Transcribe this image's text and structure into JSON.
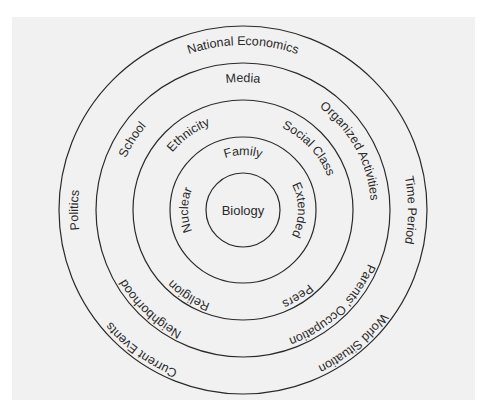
{
  "diagram": {
    "type": "concentric-circles",
    "center": {
      "label": "Biology"
    },
    "rings": [
      {
        "level": 1,
        "labels": {
          "top": "Family",
          "right": "Extended",
          "left": "Nuclear"
        }
      },
      {
        "level": 2,
        "labels": {
          "upper_right": "Social Class",
          "lower_right": "Peers",
          "lower_left": "Religion",
          "upper_left": "Ethnicity"
        }
      },
      {
        "level": 3,
        "labels": {
          "top": "Media",
          "upper_right": "Organized Activities",
          "lower_right": "Parents' Occupation",
          "lower_left": "Neighborhood",
          "upper_left": "School"
        }
      },
      {
        "level": 4,
        "labels": {
          "top": "National Economics",
          "right": "Time Period",
          "lower_right": "World Situation",
          "lower_left": "Current Events",
          "left": "Politics"
        }
      }
    ],
    "colors": {
      "line": "#2a2a2a",
      "background": "#f1f1f1",
      "page": "#ffffff"
    }
  }
}
